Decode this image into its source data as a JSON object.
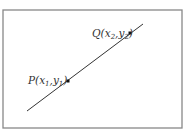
{
  "diagram": {
    "type": "line-through-two-points",
    "frame": {
      "x": 3,
      "y": 10,
      "width": 179,
      "height": 118,
      "stroke": "#888888"
    },
    "line": {
      "x1": 27,
      "y1": 111,
      "x2": 143,
      "y2": 24,
      "stroke": "#333333"
    },
    "points": [
      {
        "id": "P",
        "label": "P",
        "x": 68,
        "y": 81,
        "label_x": 28,
        "label_y": 82,
        "coords": [
          {
            "var": "x",
            "sub": "1"
          },
          {
            "var": "y",
            "sub": "1"
          }
        ]
      },
      {
        "id": "Q",
        "label": "Q",
        "x": 130,
        "y": 33,
        "label_x": 92,
        "label_y": 36,
        "coords": [
          {
            "var": "x",
            "sub": "2"
          },
          {
            "var": "y",
            "sub": "2"
          }
        ]
      }
    ]
  },
  "labels": {
    "P": {
      "name": "P",
      "open": "(",
      "x": "x",
      "x_sub": "1",
      "comma": ",",
      "y": "y",
      "y_sub": "1",
      "close": ")"
    },
    "Q": {
      "name": "Q",
      "open": "(",
      "x": "x",
      "x_sub": "2",
      "comma": ",",
      "y": "y",
      "y_sub": "2",
      "close": ")"
    }
  }
}
